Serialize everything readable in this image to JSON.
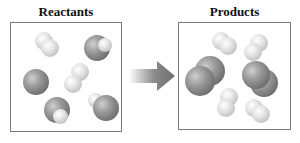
{
  "reactants": {
    "title": "Reactants",
    "molecules": [
      {
        "type": "H2",
        "description": "two small light atoms"
      },
      {
        "type": "O2-with-H",
        "description": "large dark atom with small light atom"
      },
      {
        "type": "large-dark-single",
        "description": "large dark atom"
      },
      {
        "type": "H2",
        "description": "two small light atoms (center)"
      },
      {
        "type": "large-dark-with-light",
        "description": "large dark atom with small light atom"
      },
      {
        "type": "large-dark-with-light",
        "description": "large dark atom with small light atom"
      }
    ]
  },
  "arrow": {
    "label": "",
    "direction": "right"
  },
  "products": {
    "title": "Products",
    "molecules": [
      {
        "type": "H2",
        "description": "two small light atoms"
      },
      {
        "type": "H2",
        "description": "two small light atoms"
      },
      {
        "type": "diatomic-dark",
        "description": "two large dark atoms"
      },
      {
        "type": "diatomic-dark",
        "description": "two large dark atoms"
      },
      {
        "type": "H2",
        "description": "two small light atoms"
      },
      {
        "type": "H2",
        "description": "two small light atoms"
      }
    ]
  },
  "colors": {
    "border": "#7a7a7a",
    "dark_atom": "#7a7a7a",
    "light_atom": "#e6e6e6",
    "arrow": "#777777"
  }
}
